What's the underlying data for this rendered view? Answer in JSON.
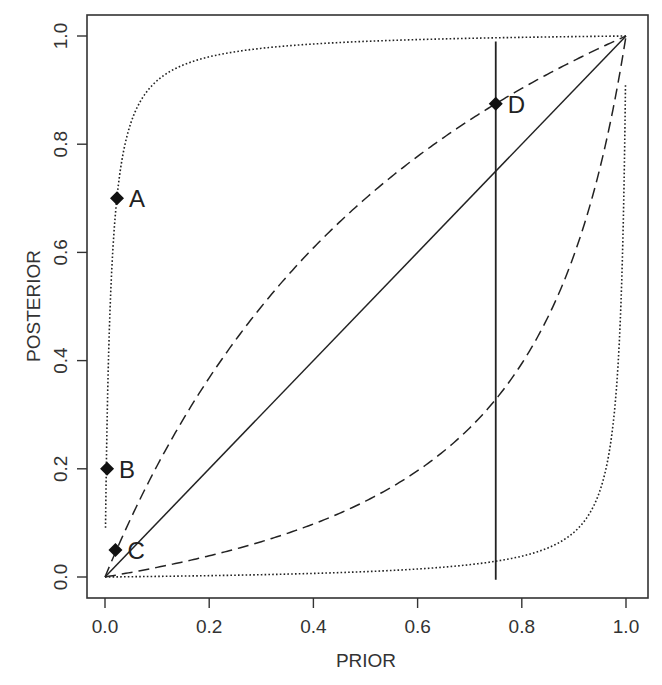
{
  "chart_data": {
    "type": "line",
    "title": "",
    "xlabel": "PRIOR",
    "ylabel": "POSTERIOR",
    "xlim": [
      0,
      1
    ],
    "ylim": [
      0,
      1
    ],
    "grid": false,
    "legend": null,
    "x_ticks": [
      "0.0",
      "0.2",
      "0.4",
      "0.6",
      "0.8",
      "1.0"
    ],
    "y_ticks": [
      "0.0",
      "0.2",
      "0.4",
      "0.6",
      "0.8",
      "1.0"
    ],
    "series": [
      {
        "name": "identity (likelihood ratio 1)",
        "style": "solid",
        "likelihood_ratio": 1,
        "x": [
          0,
          1
        ],
        "y": [
          0,
          1
        ]
      },
      {
        "name": "likelihood ratio ~2.33",
        "style": "dashed",
        "likelihood_ratio": 2.33,
        "x": [
          0,
          0.05,
          0.1,
          0.2,
          0.3,
          0.4,
          0.5,
          0.6,
          0.7,
          0.75,
          0.8,
          0.9,
          1.0
        ],
        "y": [
          0,
          0.109,
          0.206,
          0.368,
          0.5,
          0.608,
          0.7,
          0.778,
          0.845,
          0.875,
          0.903,
          0.954,
          1.0
        ]
      },
      {
        "name": "likelihood ratio ~0.163",
        "style": "dashed",
        "likelihood_ratio": 0.163,
        "x": [
          0,
          0.1,
          0.2,
          0.3,
          0.4,
          0.5,
          0.6,
          0.7,
          0.75,
          0.8,
          0.9,
          0.95,
          1.0
        ],
        "y": [
          0,
          0.018,
          0.039,
          0.065,
          0.098,
          0.14,
          0.197,
          0.276,
          0.328,
          0.395,
          0.595,
          0.756,
          1.0
        ]
      },
      {
        "name": "likelihood ratio ~100",
        "style": "dotted",
        "likelihood_ratio": 100,
        "x": [
          0.001,
          0.005,
          0.01,
          0.023,
          0.05,
          0.1,
          0.2,
          0.4,
          0.6,
          0.8,
          1.0
        ],
        "y": [
          0.09,
          0.334,
          0.503,
          0.704,
          0.84,
          0.917,
          0.962,
          0.985,
          0.993,
          0.998,
          1.0
        ]
      },
      {
        "name": "likelihood ratio ~0.01",
        "style": "dotted",
        "likelihood_ratio": 0.01,
        "x": [
          0,
          0.2,
          0.4,
          0.6,
          0.8,
          0.9,
          0.95,
          0.98,
          0.99,
          0.995,
          0.999
        ],
        "y": [
          0,
          0.0025,
          0.0067,
          0.0148,
          0.0388,
          0.083,
          0.16,
          0.329,
          0.497,
          0.666,
          0.909
        ]
      }
    ],
    "vertical_line": {
      "x": 0.75,
      "y_from": -0.005,
      "y_to": 0.99,
      "style": "solid"
    },
    "points": [
      {
        "label": "A",
        "x": 0.023,
        "y": 0.7,
        "marker": "diamond"
      },
      {
        "label": "B",
        "x": 0.004,
        "y": 0.2,
        "marker": "diamond"
      },
      {
        "label": "C",
        "x": 0.02,
        "y": 0.05,
        "marker": "diamond"
      },
      {
        "label": "D",
        "x": 0.75,
        "y": 0.875,
        "marker": "diamond"
      }
    ],
    "annotations": [
      {
        "text": "A",
        "near_point": "A"
      },
      {
        "text": "B",
        "near_point": "B"
      },
      {
        "text": "C",
        "near_point": "C"
      },
      {
        "text": "D",
        "near_point": "D"
      }
    ]
  },
  "axes": {
    "x_title": "PRIOR",
    "y_title": "POSTERIOR"
  },
  "colors": {
    "line": "#222222",
    "frame": "#333333",
    "text": "#333333",
    "background": "#ffffff"
  }
}
